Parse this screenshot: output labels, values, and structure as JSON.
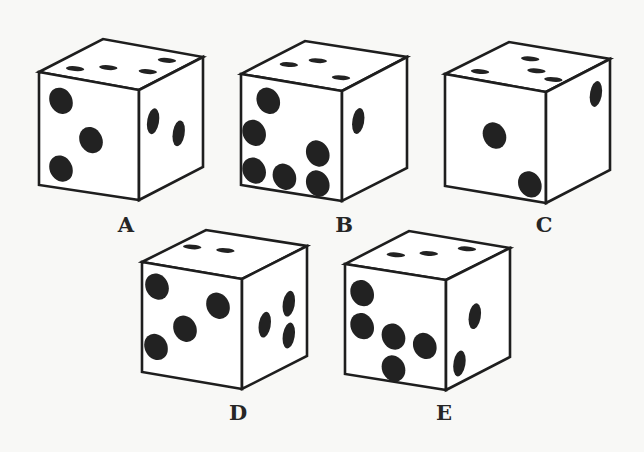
{
  "colors": {
    "background": "#f8f8f6",
    "face": "#ffffff",
    "outline": "#1e1e1e",
    "pip": "#222222"
  },
  "dice": [
    {
      "label": "A",
      "faces": {
        "top": {
          "value": 4,
          "pips": [
            [
              0.22,
              0.78
            ],
            [
              0.45,
              0.62
            ],
            [
              0.8,
              0.55
            ],
            [
              0.78,
              0.22
            ]
          ]
        },
        "front": {
          "value": 3,
          "pips": [
            [
              0.22,
              0.22
            ],
            [
              0.52,
              0.52
            ],
            [
              0.22,
              0.82
            ]
          ]
        },
        "right": {
          "value": 2,
          "pips": [
            [
              0.22,
              0.35
            ],
            [
              0.62,
              0.58
            ]
          ]
        }
      }
    },
    {
      "label": "B",
      "faces": {
        "top": {
          "value": 3,
          "pips": [
            [
              0.22,
              0.6
            ],
            [
              0.38,
              0.4
            ],
            [
              0.8,
              0.7
            ]
          ]
        },
        "front": {
          "value": 6,
          "pips": [
            [
              0.27,
              0.2
            ],
            [
              0.13,
              0.51
            ],
            [
              0.13,
              0.85
            ],
            [
              0.43,
              0.86
            ],
            [
              0.76,
              0.87
            ],
            [
              0.76,
              0.6
            ]
          ]
        },
        "right": {
          "value": 1,
          "pips": [
            [
              0.25,
              0.35
            ]
          ]
        }
      }
    },
    {
      "label": "C",
      "faces": {
        "top": {
          "value": 4,
          "pips": [
            [
              0.22,
              0.8
            ],
            [
              0.4,
              0.3
            ],
            [
              0.62,
              0.55
            ],
            [
              0.87,
              0.68
            ]
          ]
        },
        "front": {
          "value": 2,
          "pips": [
            [
              0.49,
              0.47
            ],
            [
              0.84,
              0.85
            ]
          ]
        },
        "right": {
          "value": 1,
          "pips": [
            [
              0.78,
              0.25
            ]
          ]
        }
      }
    },
    {
      "label": "D",
      "faces": {
        "top": {
          "value": 2,
          "pips": [
            [
              0.15,
              0.45
            ],
            [
              0.45,
              0.4
            ]
          ]
        },
        "front": {
          "value": 4,
          "pips": [
            [
              0.15,
              0.2
            ],
            [
              0.76,
              0.28
            ],
            [
              0.43,
              0.54
            ],
            [
              0.14,
              0.75
            ]
          ]
        },
        "right": {
          "value": 3,
          "pips": [
            [
              0.35,
              0.52
            ],
            [
              0.72,
              0.44
            ],
            [
              0.72,
              0.73
            ]
          ]
        }
      }
    },
    {
      "label": "E",
      "faces": {
        "top": {
          "value": 3,
          "pips": [
            [
              0.25,
              0.6
            ],
            [
              0.48,
              0.45
            ],
            [
              0.7,
              0.2
            ]
          ]
        },
        "front": {
          "value": 5,
          "pips": [
            [
              0.17,
              0.24
            ],
            [
              0.17,
              0.54
            ],
            [
              0.48,
              0.59
            ],
            [
              0.79,
              0.63
            ],
            [
              0.48,
              0.88
            ]
          ]
        },
        "right": {
          "value": 2,
          "pips": [
            [
              0.45,
              0.46
            ],
            [
              0.21,
              0.82
            ]
          ]
        }
      }
    }
  ]
}
